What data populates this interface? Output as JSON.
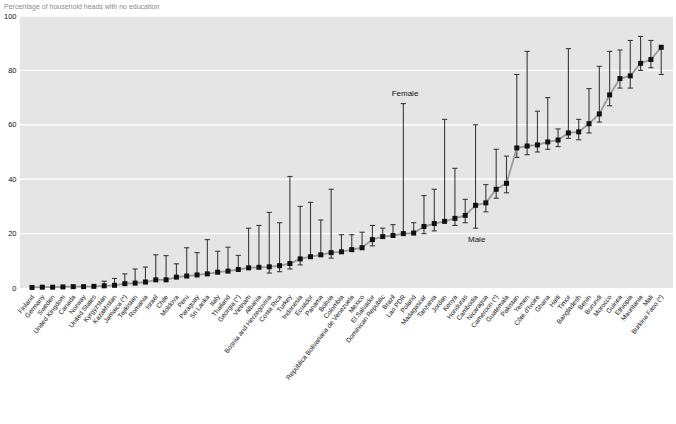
{
  "title": "Percentage of household heads with no education",
  "annotations": {
    "female": "Female",
    "male": "Male"
  },
  "colors": {
    "plot_bg": "#e5e5e5",
    "grid": "#ffffff",
    "marker": "#111111",
    "connect_line": "#9a9a9a",
    "whisker": "#3a3a3a",
    "title_text": "#8a8a8a",
    "axis_text": "#111111"
  },
  "chart_data": {
    "type": "scatter",
    "title": "Percentage of household heads with no education",
    "xlabel": "",
    "ylabel": "",
    "ylim": [
      0,
      100
    ],
    "yticks": [
      0,
      20,
      40,
      60,
      80,
      100
    ],
    "grid": true,
    "legend_position": "in-plot annotations",
    "series": [
      {
        "name": "Male",
        "role": "square markers connected by gray line"
      },
      {
        "name": "Female",
        "role": "top of vertical range bar above male marker"
      }
    ],
    "categories": [
      "Finland",
      "Germany",
      "Sweden",
      "United Kingdom",
      "Canada",
      "Norway",
      "United States",
      "Kyrgyzstan",
      "Kazakhstan",
      "Jamaica (*)",
      "Tajikistan",
      "Romania",
      "Israel",
      "Chile",
      "Moldova",
      "Peru",
      "Paraguay",
      "Sri Lanka",
      "Italy",
      "Thailand",
      "Georgia (*)",
      "Vietnam",
      "Albania",
      "Bosnia and Herzegovina",
      "Costa Rica",
      "Turkey",
      "Indonesia",
      "Ecuador",
      "Panama",
      "Bolivia",
      "Colombia",
      "República Bolivariana de Venezuela",
      "Mexico",
      "El Salvador",
      "Dominican Republic",
      "Brazil",
      "Lao PDR",
      "Poland",
      "Madagascar",
      "Tanzania",
      "Jordan",
      "Kenya",
      "Honduras",
      "Cambodia",
      "Nicaragua",
      "Cameroon (*)",
      "Guatemala",
      "Pakistan",
      "Yemen",
      "Côte d'Ivoire",
      "Ghana",
      "Haiti",
      "Timor",
      "Bangladesh",
      "Benin",
      "Burundi",
      "Morocco",
      "Guinea",
      "Ethiopia",
      "Mauritania",
      "Mali",
      "Burkina Faso (*)"
    ],
    "male": [
      0.2,
      0.3,
      0.3,
      0.4,
      0.5,
      0.5,
      0.6,
      0.8,
      1.0,
      1.6,
      1.8,
      2.2,
      3.0,
      3.0,
      4.0,
      4.4,
      4.8,
      5.2,
      5.8,
      6.2,
      6.8,
      7.4,
      7.6,
      7.8,
      8.2,
      9.0,
      10.7,
      11.5,
      12.2,
      13.0,
      13.3,
      14.1,
      14.8,
      17.8,
      18.9,
      19.3,
      20.0,
      20.2,
      22.6,
      23.7,
      24.5,
      25.6,
      26.7,
      30.4,
      31.3,
      36.3,
      38.5,
      51.5,
      52.2,
      52.6,
      53.7,
      54.4,
      57.0,
      57.4,
      60.4,
      64.0,
      71.0,
      77.0,
      78.0,
      82.6,
      84.0,
      88.5
    ],
    "female": [
      0.4,
      0.5,
      0.6,
      0.8,
      0.9,
      1.0,
      1.2,
      2.5,
      3.5,
      5.2,
      7.0,
      7.7,
      12.2,
      11.9,
      8.9,
      14.8,
      13.0,
      17.8,
      13.5,
      15.0,
      12.0,
      22.0,
      23.0,
      27.8,
      24.0,
      41.0,
      30.0,
      31.5,
      25.0,
      36.3,
      19.6,
      19.6,
      20.5,
      23.0,
      22.0,
      23.3,
      67.8,
      24.0,
      34.0,
      36.3,
      62.0,
      44.0,
      32.6,
      60.0,
      38.0,
      51.0,
      48.5,
      78.5,
      87.0,
      65.0,
      70.0,
      58.5,
      88.0,
      62.0,
      73.3,
      81.5,
      87.0,
      87.5,
      91.0,
      92.5,
      91.0,
      78.5
    ],
    "low": [
      null,
      null,
      null,
      null,
      null,
      null,
      null,
      null,
      null,
      null,
      null,
      null,
      null,
      null,
      null,
      null,
      null,
      null,
      null,
      null,
      null,
      null,
      null,
      5.5,
      6,
      7,
      8.5,
      null,
      null,
      11,
      null,
      null,
      null,
      15.5,
      null,
      null,
      null,
      null,
      20,
      21,
      null,
      23,
      24,
      22,
      28,
      33,
      35,
      48,
      49,
      50,
      51,
      52,
      55,
      54.5,
      57,
      61,
      67,
      73.5,
      73.5,
      80,
      81,
      null
    ]
  }
}
